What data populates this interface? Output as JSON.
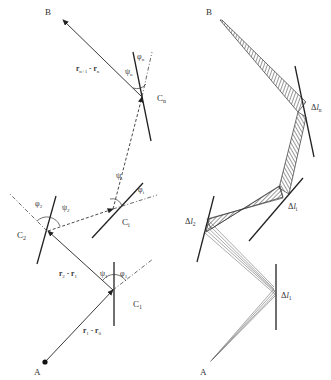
{
  "left_panel": {
    "point_labels": {
      "start": "A",
      "end": "B",
      "c1": "C",
      "c1_sub": "1",
      "c2": "C",
      "c2_sub": "2",
      "ci": "C",
      "ci_sub": "i",
      "cn": "C",
      "cn_sub": "n"
    },
    "vector_labels": {
      "r1_r0": {
        "a": "r",
        "a_sub": "1",
        "op": " - ",
        "b": "r",
        "b_sub": "0"
      },
      "r2_r1": {
        "a": "r",
        "a_sub": "2",
        "op": " - ",
        "b": "r",
        "b_sub": "1"
      },
      "rn1_rn": {
        "a": "r",
        "a_sub": "n+1",
        "op": " - ",
        "b": "r",
        "b_sub": "n"
      }
    },
    "angle_labels": {
      "phi1": {
        "sym": "φ",
        "sub": "1"
      },
      "psi1": {
        "sym": "ψ",
        "sub": "1"
      },
      "phi2": {
        "sym": "φ",
        "sub": "2"
      },
      "psi2": {
        "sym": "ψ",
        "sub": "2"
      },
      "phii": {
        "sym": "φ",
        "sub": "i"
      },
      "psii": {
        "sym": "ψ",
        "sub": "i"
      },
      "phin": {
        "sym": "φ",
        "sub": "n"
      },
      "psin": {
        "sym": "ψ",
        "sub": "n"
      }
    }
  },
  "right_panel": {
    "point_labels": {
      "start": "A",
      "end": "B"
    },
    "segment_labels": {
      "dl1": {
        "delta": "Δ",
        "sym": "l",
        "sub": "1"
      },
      "dl2": {
        "delta": "Δ",
        "sym": "l",
        "sub": "2"
      },
      "dli": {
        "delta": "Δ",
        "sym": "l",
        "sub": "i"
      },
      "dln": {
        "delta": "Δ",
        "sym": "l",
        "sub": "n"
      }
    }
  },
  "colors": {
    "line": "#222222",
    "dashed": "#444444",
    "label": "#333333"
  }
}
